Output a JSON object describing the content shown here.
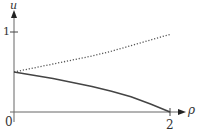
{
  "chart_data": {
    "type": "line",
    "title": "",
    "xlabel": "ρ",
    "ylabel": "u",
    "xlim": [
      0,
      2.2
    ],
    "ylim": [
      0,
      1.1
    ],
    "grid": false,
    "legend": null,
    "x_ticks": [
      {
        "value": 0,
        "label": "0"
      },
      {
        "value": 2,
        "label": "2"
      }
    ],
    "y_ticks": [
      {
        "value": 1,
        "label": "1"
      }
    ],
    "series": [
      {
        "name": "upper (dotted)",
        "style": "dotted",
        "color": "#555555",
        "x": [
          0,
          0.25,
          0.5,
          0.75,
          1.0,
          1.25,
          1.5,
          1.75,
          2.0
        ],
        "y": [
          0.5,
          0.55,
          0.6,
          0.65,
          0.7,
          0.76,
          0.83,
          0.9,
          0.97
        ]
      },
      {
        "name": "lower (solid)",
        "style": "solid",
        "color": "#444444",
        "x": [
          0,
          0.25,
          0.5,
          0.75,
          1.0,
          1.25,
          1.5,
          1.75,
          2.0
        ],
        "y": [
          0.5,
          0.46,
          0.42,
          0.37,
          0.32,
          0.26,
          0.19,
          0.1,
          0.0
        ]
      }
    ]
  },
  "labels": {
    "y_axis": "u",
    "x_axis": "ρ",
    "origin": "0",
    "x_tick_2": "2",
    "y_tick_1": "1"
  }
}
